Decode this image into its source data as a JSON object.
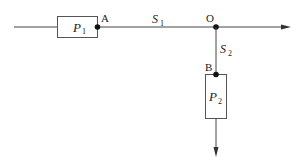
{
  "diagram": {
    "boxes": [
      {
        "id": "P1",
        "label": "P",
        "sub": "1"
      },
      {
        "id": "P2",
        "label": "P",
        "sub": "2"
      }
    ],
    "points": [
      {
        "id": "A",
        "label": "A"
      },
      {
        "id": "O",
        "label": "O"
      },
      {
        "id": "B",
        "label": "B"
      }
    ],
    "segments": [
      {
        "id": "S1",
        "label": "S",
        "sub": "1"
      },
      {
        "id": "S2",
        "label": "S",
        "sub": "2"
      }
    ],
    "colors": {
      "stroke": "#444444",
      "box_stroke": "#555555",
      "dot": "#111111"
    }
  }
}
